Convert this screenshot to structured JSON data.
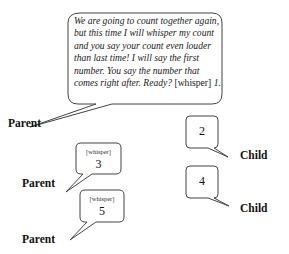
{
  "dialogue": {
    "main_bubble": {
      "speaker": "Parent",
      "text_italic": "We are going to count together again, but this time I will whisper my count and you say your count even louder than last time! I will say the first number. You say the number that comes right after. Ready?",
      "cue": "[whisper]",
      "number": "1."
    },
    "turns": [
      {
        "speaker": "Child",
        "cue": "",
        "number": "2"
      },
      {
        "speaker": "Parent",
        "cue": "[whisper]",
        "number": "3"
      },
      {
        "speaker": "Child",
        "cue": "",
        "number": "4"
      },
      {
        "speaker": "Parent",
        "cue": "[whisper]",
        "number": "5"
      }
    ]
  }
}
